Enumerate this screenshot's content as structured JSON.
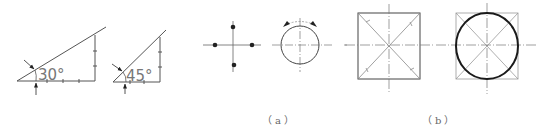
{
  "figure": {
    "colors": {
      "line": "#555555",
      "light": "#9a9a9a",
      "bold": "#222222",
      "background": "#ffffff"
    },
    "angles": [
      {
        "id": "thirty",
        "label": "30°",
        "value": 30
      },
      {
        "id": "forty-five",
        "label": "45°",
        "value": 45
      }
    ],
    "panels": [
      {
        "id": "a",
        "caption": "（a）",
        "items": [
          "four-point-cross",
          "circle-with-rotation-arrows"
        ]
      },
      {
        "id": "b",
        "caption": "（b）",
        "items": [
          "square-with-diagonals",
          "circle-inscribed-in-square"
        ]
      }
    ]
  }
}
